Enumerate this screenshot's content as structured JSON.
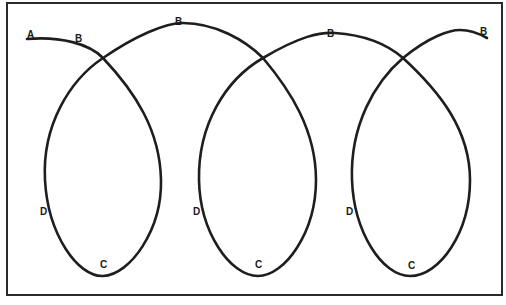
{
  "diagram": {
    "title": "",
    "frame": {
      "x": 7,
      "y": 3,
      "width": 495,
      "height": 292
    },
    "colors": {
      "stroke": "#1e1e1e",
      "frame": "#2a2a2a",
      "background": "#ffffff"
    },
    "labels": [
      {
        "id": "label-a-start",
        "text": "A",
        "x": 27,
        "y": 38
      },
      {
        "id": "label-b-1",
        "text": "B",
        "x": 75,
        "y": 42
      },
      {
        "id": "label-b-2",
        "text": "B",
        "x": 175,
        "y": 25
      },
      {
        "id": "label-b-3",
        "text": "B",
        "x": 327,
        "y": 37
      },
      {
        "id": "label-b-4",
        "text": "B",
        "x": 480,
        "y": 35
      },
      {
        "id": "label-d-1",
        "text": "D",
        "x": 40,
        "y": 215
      },
      {
        "id": "label-d-2",
        "text": "D",
        "x": 193,
        "y": 215
      },
      {
        "id": "label-d-3",
        "text": "D",
        "x": 346,
        "y": 215
      },
      {
        "id": "label-c-1",
        "text": "C",
        "x": 100,
        "y": 268
      },
      {
        "id": "label-c-2",
        "text": "C",
        "x": 255,
        "y": 268
      },
      {
        "id": "label-c-3",
        "text": "C",
        "x": 408,
        "y": 269
      }
    ],
    "loops": 3
  }
}
